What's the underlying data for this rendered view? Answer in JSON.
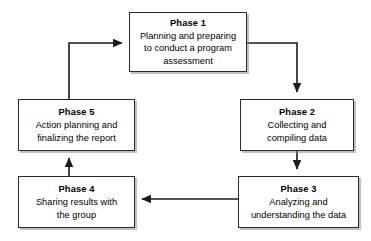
{
  "diagram": {
    "type": "cyclical-process-flowchart",
    "orientation": "clockwise-loop",
    "background_color": "#ffffff",
    "line_color": "#2b2b2b",
    "box_border_color": "#2b2b2b",
    "box_fill_color": "#ffffff",
    "text_color": "#000000",
    "nodes": [
      {
        "id": "phase-1",
        "title": "Phase 1",
        "description": "Planning and preparing to conduct a program assessment",
        "lines": [
          "Planning and preparing",
          "to conduct a program",
          "assessment"
        ]
      },
      {
        "id": "phase-2",
        "title": "Phase 2",
        "description": "Collecting and compiling data",
        "lines": [
          "Collecting and",
          "compiling data"
        ]
      },
      {
        "id": "phase-3",
        "title": "Phase 3",
        "description": "Analyzing and understanding the data",
        "lines": [
          "Analyzing and",
          "understanding the data"
        ]
      },
      {
        "id": "phase-4",
        "title": "Phase 4",
        "description": "Sharing results with the group",
        "lines": [
          "Sharing results with",
          "the group"
        ]
      },
      {
        "id": "phase-5",
        "title": "Phase 5",
        "description": "Action planning and finalizing the report",
        "lines": [
          "Action planning and",
          "finalizing the report"
        ]
      }
    ],
    "edges": [
      {
        "id": "edge-1-to-2",
        "from": "phase-1",
        "to": "phase-2",
        "label": "",
        "direction": "right-then-down"
      },
      {
        "id": "edge-2-to-3",
        "from": "phase-2",
        "to": "phase-3",
        "label": "",
        "direction": "down"
      },
      {
        "id": "edge-3-to-4",
        "from": "phase-3",
        "to": "phase-4",
        "label": "",
        "direction": "left"
      },
      {
        "id": "edge-4-to-5",
        "from": "phase-4",
        "to": "phase-5",
        "label": "",
        "direction": "up"
      },
      {
        "id": "edge-5-to-1",
        "from": "phase-5",
        "to": "phase-1",
        "label": "",
        "direction": "up-then-right"
      }
    ]
  }
}
